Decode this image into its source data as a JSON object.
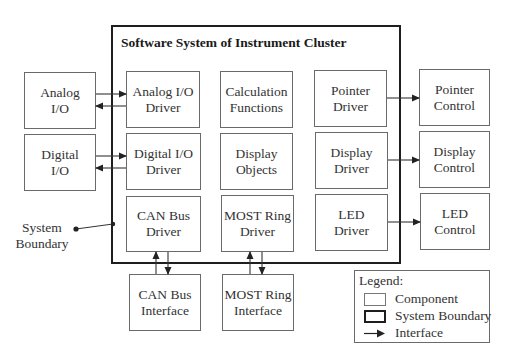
{
  "diagram": {
    "system_boundary": {
      "title": "Software System of Instrument Cluster",
      "x": 111,
      "y": 25,
      "w": 290,
      "h": 239
    },
    "components": [
      {
        "id": "analog-io",
        "label": "Analog\nI/O",
        "x": 24,
        "y": 72,
        "w": 72,
        "h": 57,
        "inside_system": false
      },
      {
        "id": "digital-io",
        "label": "Digital\nI/O",
        "x": 24,
        "y": 134,
        "w": 72,
        "h": 57,
        "inside_system": false
      },
      {
        "id": "analog-io-driver",
        "label": "Analog I/O\nDriver",
        "x": 126,
        "y": 71,
        "w": 74,
        "h": 57,
        "inside_system": true
      },
      {
        "id": "digital-io-driver",
        "label": "Digital I/O\nDriver",
        "x": 126,
        "y": 133,
        "w": 75,
        "h": 57,
        "inside_system": true
      },
      {
        "id": "can-bus-driver",
        "label": "CAN Bus\nDriver",
        "x": 126,
        "y": 196,
        "w": 75,
        "h": 56,
        "inside_system": true
      },
      {
        "id": "calculation-functions",
        "label": "Calculation\nFunctions",
        "x": 220,
        "y": 71,
        "w": 73,
        "h": 57,
        "inside_system": true
      },
      {
        "id": "display-objects",
        "label": "Display\nObjects",
        "x": 220,
        "y": 133,
        "w": 73,
        "h": 57,
        "inside_system": true
      },
      {
        "id": "most-ring-driver",
        "label": "MOST Ring\nDriver",
        "x": 221,
        "y": 195,
        "w": 73,
        "h": 57,
        "inside_system": true
      },
      {
        "id": "pointer-driver",
        "label": "Pointer\nDriver",
        "x": 314,
        "y": 70,
        "w": 73,
        "h": 57,
        "inside_system": true
      },
      {
        "id": "display-driver",
        "label": "Display\nDriver",
        "x": 315,
        "y": 132,
        "w": 73,
        "h": 57,
        "inside_system": true
      },
      {
        "id": "led-driver",
        "label": "LED\nDriver",
        "x": 315,
        "y": 194,
        "w": 73,
        "h": 57,
        "inside_system": true
      },
      {
        "id": "pointer-control",
        "label": "Pointer\nControl",
        "x": 419,
        "y": 69,
        "w": 71,
        "h": 57,
        "inside_system": false
      },
      {
        "id": "display-control",
        "label": "Display\nControl",
        "x": 419,
        "y": 131,
        "w": 71,
        "h": 57,
        "inside_system": false
      },
      {
        "id": "led-control",
        "label": "LED\nControl",
        "x": 420,
        "y": 193,
        "w": 70,
        "h": 57,
        "inside_system": false
      },
      {
        "id": "can-bus-interface",
        "label": "CAN Bus\nInterface",
        "x": 129,
        "y": 274,
        "w": 72,
        "h": 57,
        "inside_system": false
      },
      {
        "id": "most-ring-interface",
        "label": "MOST Ring\nInterface",
        "x": 222,
        "y": 274,
        "w": 72,
        "h": 57,
        "inside_system": false
      }
    ],
    "interfaces": [
      {
        "from": "analog-io",
        "to": "analog-io-driver",
        "x1": 96,
        "y1": 94,
        "x2": 126,
        "y2": 94
      },
      {
        "from": "analog-io-driver",
        "to": "analog-io",
        "x1": 126,
        "y1": 106,
        "x2": 96,
        "y2": 106
      },
      {
        "from": "digital-io",
        "to": "digital-io-driver",
        "x1": 96,
        "y1": 156,
        "x2": 126,
        "y2": 156
      },
      {
        "from": "digital-io-driver",
        "to": "digital-io",
        "x1": 126,
        "y1": 168,
        "x2": 96,
        "y2": 168
      },
      {
        "from": "pointer-driver",
        "to": "pointer-control",
        "x1": 387,
        "y1": 98,
        "x2": 419,
        "y2": 98
      },
      {
        "from": "display-driver",
        "to": "display-control",
        "x1": 388,
        "y1": 160,
        "x2": 419,
        "y2": 160
      },
      {
        "from": "led-driver",
        "to": "led-control",
        "x1": 388,
        "y1": 222,
        "x2": 420,
        "y2": 222
      },
      {
        "from": "can-bus-interface",
        "to": "can-bus-driver",
        "x1": 156,
        "y1": 274,
        "x2": 156,
        "y2": 252
      },
      {
        "from": "can-bus-driver",
        "to": "can-bus-interface",
        "x1": 168,
        "y1": 252,
        "x2": 168,
        "y2": 274
      },
      {
        "from": "most-ring-interface",
        "to": "most-ring-driver",
        "x1": 250,
        "y1": 274,
        "x2": 250,
        "y2": 252
      },
      {
        "from": "most-ring-driver",
        "to": "most-ring-interface",
        "x1": 262,
        "y1": 252,
        "x2": 262,
        "y2": 274
      }
    ],
    "callout": {
      "label": "System\nBoundary",
      "x": 10,
      "y": 220,
      "w": 64,
      "dot": {
        "x": 76,
        "y": 229
      },
      "target": {
        "x": 113,
        "y": 224
      }
    },
    "legend": {
      "title": "Legend:",
      "x": 354,
      "y": 270,
      "w": 136,
      "h": 73,
      "items": [
        {
          "kind": "component",
          "label": "Component"
        },
        {
          "kind": "system-boundary",
          "label": "System Boundary"
        },
        {
          "kind": "interface",
          "label": "Interface"
        }
      ]
    }
  },
  "colors": {
    "component_border": "#6a6a6a",
    "boundary_border": "#1e1e1e",
    "arrow": "#333333",
    "background": "#ffffff"
  }
}
